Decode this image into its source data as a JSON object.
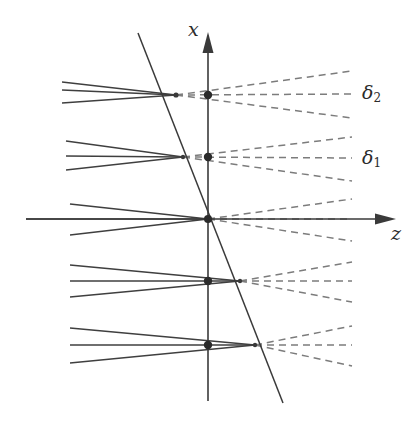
{
  "figure": {
    "width": 420,
    "height": 428,
    "background": "#ffffff"
  },
  "axes": {
    "vertical": {
      "name": "x",
      "label": "x",
      "x": 208,
      "y_top": 36,
      "y_bottom": 401,
      "arrow_at": "top",
      "color": "#3a3a3a"
    },
    "horizontal": {
      "name": "z",
      "label": "z",
      "y": 219,
      "x_left": 26,
      "x_right": 392,
      "arrow_at": "right",
      "color": "#3a3a3a"
    },
    "origin": {
      "x": 208,
      "y": 219
    }
  },
  "tilted_plane": {
    "name": "object-plane",
    "x1": 138,
    "y1": 33,
    "x2": 283,
    "y2": 403,
    "color": "#3a3a3a"
  },
  "annotations": [
    {
      "id": "delta2",
      "label": "δ",
      "subscript": "2",
      "x": 362,
      "y": 83
    },
    {
      "id": "delta1",
      "label": "δ",
      "subscript": "1",
      "x": 362,
      "y": 148
    }
  ],
  "colors": {
    "solid_ray": "#3f3f3f",
    "dashed_ray": "#7c7c7c",
    "axis": "#3a3a3a",
    "dot": "#2b2b2b"
  },
  "chart_data": {
    "type": "diagram",
    "xlabel": "z",
    "ylabel": "x",
    "bundles": [
      {
        "id": "bundle-top",
        "focus": {
          "x": 176,
          "y": 95
        },
        "axis_dot": {
          "x": 208,
          "y": 95,
          "r": 4.2
        },
        "focus_dot": {
          "x": 176,
          "y": 95,
          "r": 2.6
        },
        "solid_rays": [
          {
            "x1": 62,
            "y1": 82,
            "x2": 176,
            "y2": 95
          },
          {
            "x1": 62,
            "y1": 90,
            "x2": 176,
            "y2": 95
          },
          {
            "x1": 62,
            "y1": 103,
            "x2": 176,
            "y2": 95
          }
        ],
        "dashed_rays": [
          {
            "x1": 176,
            "y1": 95,
            "x2": 352,
            "y2": 71
          },
          {
            "x1": 176,
            "y1": 95,
            "x2": 352,
            "y2": 94
          },
          {
            "x1": 176,
            "y1": 95,
            "x2": 352,
            "y2": 118
          }
        ]
      },
      {
        "id": "bundle-upper-mid",
        "focus": {
          "x": 183,
          "y": 157
        },
        "axis_dot": {
          "x": 208,
          "y": 157,
          "r": 4.2
        },
        "focus_dot": {
          "x": 183,
          "y": 157,
          "r": 2.2
        },
        "solid_rays": [
          {
            "x1": 66,
            "y1": 141,
            "x2": 183,
            "y2": 157
          },
          {
            "x1": 66,
            "y1": 156,
            "x2": 183,
            "y2": 157
          },
          {
            "x1": 66,
            "y1": 170,
            "x2": 183,
            "y2": 157
          }
        ],
        "dashed_rays": [
          {
            "x1": 183,
            "y1": 157,
            "x2": 352,
            "y2": 137
          },
          {
            "x1": 183,
            "y1": 157,
            "x2": 352,
            "y2": 158
          },
          {
            "x1": 183,
            "y1": 157,
            "x2": 352,
            "y2": 181
          }
        ]
      },
      {
        "id": "bundle-center",
        "focus": {
          "x": 208,
          "y": 219
        },
        "axis_dot": {
          "x": 208,
          "y": 219,
          "r": 4.0
        },
        "focus_dot": null,
        "solid_rays": [
          {
            "x1": 70,
            "y1": 204,
            "x2": 208,
            "y2": 219
          },
          {
            "x1": 26,
            "y1": 219,
            "x2": 208,
            "y2": 219
          },
          {
            "x1": 70,
            "y1": 235,
            "x2": 208,
            "y2": 219
          }
        ],
        "dashed_rays": [
          {
            "x1": 208,
            "y1": 219,
            "x2": 352,
            "y2": 199
          },
          {
            "x1": 208,
            "y1": 219,
            "x2": 352,
            "y2": 219
          },
          {
            "x1": 208,
            "y1": 219,
            "x2": 352,
            "y2": 241
          }
        ]
      },
      {
        "id": "bundle-lower-mid",
        "focus": {
          "x": 240,
          "y": 281
        },
        "axis_dot": {
          "x": 208,
          "y": 281,
          "r": 4.2
        },
        "focus_dot": {
          "x": 240,
          "y": 281,
          "r": 2.2
        },
        "solid_rays": [
          {
            "x1": 70,
            "y1": 265,
            "x2": 240,
            "y2": 281
          },
          {
            "x1": 70,
            "y1": 281,
            "x2": 240,
            "y2": 281
          },
          {
            "x1": 70,
            "y1": 297,
            "x2": 240,
            "y2": 281
          }
        ],
        "dashed_rays": [
          {
            "x1": 240,
            "y1": 281,
            "x2": 352,
            "y2": 262
          },
          {
            "x1": 240,
            "y1": 281,
            "x2": 352,
            "y2": 281
          },
          {
            "x1": 240,
            "y1": 281,
            "x2": 352,
            "y2": 302
          }
        ]
      },
      {
        "id": "bundle-bottom",
        "focus": {
          "x": 255,
          "y": 345
        },
        "axis_dot": {
          "x": 208,
          "y": 345,
          "r": 4.2
        },
        "focus_dot": {
          "x": 255,
          "y": 345,
          "r": 2.2
        },
        "solid_rays": [
          {
            "x1": 70,
            "y1": 328,
            "x2": 255,
            "y2": 345
          },
          {
            "x1": 70,
            "y1": 345,
            "x2": 255,
            "y2": 345
          },
          {
            "x1": 70,
            "y1": 363,
            "x2": 255,
            "y2": 345
          }
        ],
        "dashed_rays": [
          {
            "x1": 255,
            "y1": 345,
            "x2": 352,
            "y2": 326
          },
          {
            "x1": 255,
            "y1": 345,
            "x2": 352,
            "y2": 345
          },
          {
            "x1": 255,
            "y1": 345,
            "x2": 352,
            "y2": 366
          }
        ]
      }
    ]
  }
}
